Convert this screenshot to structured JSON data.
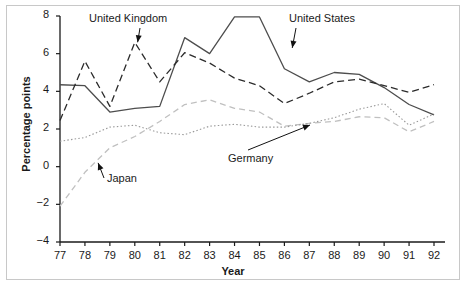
{
  "chart_data": {
    "type": "line",
    "title": "",
    "xlabel": "Year",
    "ylabel": "Percentage points",
    "xlim": [
      77,
      92.5
    ],
    "ylim": [
      -4,
      8
    ],
    "grid": false,
    "legend_position": "inline-annotations",
    "x": [
      77,
      78,
      79,
      80,
      81,
      82,
      83,
      84,
      85,
      86,
      87,
      88,
      89,
      90,
      91,
      92
    ],
    "xtick_labels": [
      "77",
      "78",
      "79",
      "80",
      "81",
      "82",
      "83",
      "84",
      "85",
      "86",
      "87",
      "88",
      "89",
      "90",
      "91",
      "92"
    ],
    "ytick_labels": [
      "8",
      "6",
      "4",
      "2",
      "0",
      "-2",
      "-4"
    ],
    "ytick_values": [
      8,
      6,
      4,
      2,
      0,
      -2,
      -4
    ],
    "series": [
      {
        "name": "United States",
        "style": "solid",
        "color": "#4d4d4d",
        "values": [
          4.35,
          4.3,
          2.9,
          3.1,
          3.2,
          6.85,
          6.0,
          7.95,
          7.95,
          5.2,
          4.5,
          5.0,
          4.9,
          4.2,
          3.3,
          2.75
        ]
      },
      {
        "name": "United Kingdom",
        "style": "dashed",
        "color": "#2b2b2b",
        "values": [
          2.45,
          5.6,
          3.2,
          6.6,
          4.5,
          6.05,
          5.5,
          4.7,
          4.3,
          3.35,
          3.9,
          4.5,
          4.65,
          4.3,
          3.95,
          4.35
        ]
      },
      {
        "name": "Japan",
        "style": "dashed-light",
        "color": "#c0c0c0",
        "values": [
          -2.1,
          -0.3,
          1.0,
          1.6,
          2.4,
          3.3,
          3.55,
          3.1,
          2.9,
          2.15,
          2.3,
          2.4,
          2.65,
          2.6,
          1.85,
          2.4
        ]
      },
      {
        "name": "Germany",
        "style": "dotted",
        "color": "#9a9a9a",
        "values": [
          1.35,
          1.55,
          2.1,
          2.2,
          1.8,
          1.7,
          2.15,
          2.25,
          2.1,
          2.1,
          2.3,
          2.6,
          3.05,
          3.35,
          2.2,
          2.8
        ]
      }
    ],
    "annotations": [
      {
        "label": "United Kingdom",
        "target_x": 80.1,
        "target_y": 6.5
      },
      {
        "label": "United States",
        "target_x": 86.3,
        "target_y": 6.2
      },
      {
        "label": "Japan",
        "target_x": 78.5,
        "target_y": 0.3
      },
      {
        "label": "Germany",
        "target_x": 87.1,
        "target_y": 2.25
      }
    ]
  },
  "axes": {
    "y_title": "Percentage points",
    "x_title": "Year",
    "yticks": [
      "8",
      "6",
      "4",
      "2",
      "0",
      "−2",
      "−4"
    ],
    "xticks": [
      "77",
      "78",
      "79",
      "80",
      "81",
      "82",
      "83",
      "84",
      "85",
      "86",
      "87",
      "88",
      "89",
      "90",
      "91",
      "92"
    ]
  },
  "labels": {
    "uk": "United Kingdom",
    "us": "United States",
    "japan": "Japan",
    "germany": "Germany"
  }
}
